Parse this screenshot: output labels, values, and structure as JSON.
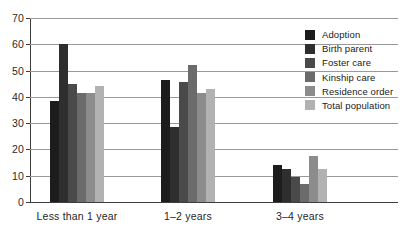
{
  "chart_data": {
    "type": "bar",
    "title": "",
    "subtitle": "",
    "xlabel": "",
    "ylabel": "",
    "ylim": [
      0,
      70
    ],
    "ytick_step": 10,
    "yticks": [
      0,
      10,
      20,
      30,
      40,
      50,
      60,
      70
    ],
    "grid": true,
    "legend_position": "top-right",
    "categories": [
      "Less than 1 year",
      "1–2 years",
      "3–4 years"
    ],
    "series": [
      {
        "name": "Adoption",
        "color": "#1c1c1c",
        "values": [
          38.5,
          46.5,
          14.0
        ]
      },
      {
        "name": "Birth parent",
        "color": "#2e2e2e",
        "values": [
          60.0,
          28.5,
          12.5
        ]
      },
      {
        "name": "Foster care",
        "color": "#4a4a4a",
        "values": [
          45.0,
          45.5,
          9.5
        ]
      },
      {
        "name": "Kinship care",
        "color": "#6b6b6b",
        "values": [
          41.5,
          52.0,
          7.0
        ]
      },
      {
        "name": "Residence order",
        "color": "#8c8c8c",
        "values": [
          41.5,
          41.5,
          17.5
        ]
      },
      {
        "name": "Total population",
        "color": "#b2b2b2",
        "values": [
          44.0,
          43.0,
          12.5
        ]
      }
    ]
  },
  "legend": {
    "items": [
      {
        "label": "Adoption"
      },
      {
        "label": "Birth parent"
      },
      {
        "label": "Foster care"
      },
      {
        "label": "Kinship care"
      },
      {
        "label": "Residence order"
      },
      {
        "label": "Total population"
      }
    ]
  },
  "colors": {
    "axis": "#3d3d3d",
    "gridline": "#999999",
    "background": "#ffffff",
    "text": "#262626"
  }
}
